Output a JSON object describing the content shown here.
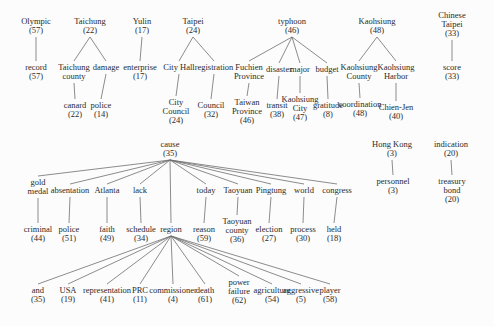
{
  "diagram": {
    "type": "tree",
    "colors": {
      "background": "#fcfcfc",
      "text": "#2b2b2b",
      "line": "#6e6e6e"
    },
    "nodes": [
      {
        "id": "olympic",
        "lines": [
          "Olympic",
          "(57)"
        ],
        "x": 36,
        "y": 17
      },
      {
        "id": "taichung",
        "lines": [
          "Taichung",
          "(22)"
        ],
        "x": 90,
        "y": 17
      },
      {
        "id": "yulin",
        "lines": [
          "Yulin",
          "(17)"
        ],
        "x": 142,
        "y": 17
      },
      {
        "id": "taipei",
        "lines": [
          "Taipei",
          "(24)"
        ],
        "x": 193,
        "y": 17
      },
      {
        "id": "typhoon",
        "lines": [
          "typhoon",
          "(46)"
        ],
        "x": 292,
        "y": 17
      },
      {
        "id": "kaohsiung",
        "lines": [
          "Kaohsiung",
          "(48)"
        ],
        "x": 377,
        "y": 17
      },
      {
        "id": "chinese-taipei",
        "lines": [
          "Chinese",
          "Taipei",
          "(33)"
        ],
        "x": 452,
        "y": 11
      },
      {
        "id": "record",
        "lines": [
          "record",
          "(57)"
        ],
        "x": 36,
        "y": 63
      },
      {
        "id": "taichung-county",
        "lines": [
          "Taichung",
          "county"
        ],
        "x": 74,
        "y": 63
      },
      {
        "id": "damage",
        "lines": [
          "damage"
        ],
        "x": 106,
        "y": 63
      },
      {
        "id": "enterprise",
        "lines": [
          "enterprise",
          "(17)"
        ],
        "x": 140,
        "y": 63
      },
      {
        "id": "city-hall",
        "lines": [
          "City Hall"
        ],
        "x": 179,
        "y": 63
      },
      {
        "id": "registration",
        "lines": [
          "registration"
        ],
        "x": 214,
        "y": 63
      },
      {
        "id": "fuchien-province",
        "lines": [
          "Fuchien",
          "Province"
        ],
        "x": 249,
        "y": 63
      },
      {
        "id": "disaster",
        "lines": [
          "disaster"
        ],
        "x": 279,
        "y": 65
      },
      {
        "id": "major",
        "lines": [
          "major"
        ],
        "x": 300,
        "y": 65
      },
      {
        "id": "budget",
        "lines": [
          "budget"
        ],
        "x": 327,
        "y": 65
      },
      {
        "id": "kaohsiung-county",
        "lines": [
          "Kaohsiung",
          "County"
        ],
        "x": 359,
        "y": 63
      },
      {
        "id": "kaohsiung-harbor",
        "lines": [
          "Kaohsiung",
          "Harbor"
        ],
        "x": 396,
        "y": 63
      },
      {
        "id": "score",
        "lines": [
          "score",
          "(33)"
        ],
        "x": 452,
        "y": 63
      },
      {
        "id": "canard",
        "lines": [
          "canard",
          "(22)"
        ],
        "x": 75,
        "y": 101
      },
      {
        "id": "police-14",
        "lines": [
          "police",
          "(14)"
        ],
        "x": 101,
        "y": 101
      },
      {
        "id": "city-council",
        "lines": [
          "City",
          "Council",
          "(24)"
        ],
        "x": 176,
        "y": 98
      },
      {
        "id": "council",
        "lines": [
          "Council",
          "(32)"
        ],
        "x": 211,
        "y": 101
      },
      {
        "id": "taiwan-province",
        "lines": [
          "Taiwan",
          "Province",
          "(46)"
        ],
        "x": 247,
        "y": 98
      },
      {
        "id": "transit",
        "lines": [
          "transit",
          "(38)"
        ],
        "x": 277,
        "y": 101
      },
      {
        "id": "kaohsiung-city",
        "lines": [
          "Kaohsiung",
          "City",
          "(47)"
        ],
        "x": 300,
        "y": 95
      },
      {
        "id": "gratitude",
        "lines": [
          "gratitude",
          "(8)"
        ],
        "x": 328,
        "y": 101
      },
      {
        "id": "coordination",
        "lines": [
          "coordination",
          "(48)"
        ],
        "x": 360,
        "y": 100
      },
      {
        "id": "chien-jen",
        "lines": [
          "Chien-Jen",
          "(40)"
        ],
        "x": 396,
        "y": 103
      },
      {
        "id": "cause",
        "lines": [
          "cause",
          "(35)"
        ],
        "x": 170,
        "y": 140
      },
      {
        "id": "hong-kong",
        "lines": [
          "Hong Kong",
          "(3)"
        ],
        "x": 392,
        "y": 140
      },
      {
        "id": "indication",
        "lines": [
          "indication",
          "(20)"
        ],
        "x": 451,
        "y": 140
      },
      {
        "id": "gold-medal",
        "lines": [
          "gold",
          "medal"
        ],
        "x": 38,
        "y": 178
      },
      {
        "id": "absentation",
        "lines": [
          "absentation"
        ],
        "x": 70,
        "y": 186
      },
      {
        "id": "atlanta",
        "lines": [
          "Atlanta"
        ],
        "x": 107,
        "y": 186
      },
      {
        "id": "lack",
        "lines": [
          "lack"
        ],
        "x": 140,
        "y": 186
      },
      {
        "id": "today",
        "lines": [
          "today"
        ],
        "x": 206,
        "y": 186
      },
      {
        "id": "taoyuan",
        "lines": [
          "Taoyuan"
        ],
        "x": 238,
        "y": 186
      },
      {
        "id": "pingtung",
        "lines": [
          "Pingtung"
        ],
        "x": 271,
        "y": 186
      },
      {
        "id": "world",
        "lines": [
          "world"
        ],
        "x": 304,
        "y": 186
      },
      {
        "id": "congress",
        "lines": [
          "congress"
        ],
        "x": 337,
        "y": 186
      },
      {
        "id": "personnel",
        "lines": [
          "personnel",
          "(3)"
        ],
        "x": 393,
        "y": 177
      },
      {
        "id": "treasury-bond",
        "lines": [
          "treasury",
          "bond",
          "(20)"
        ],
        "x": 452,
        "y": 177
      },
      {
        "id": "criminal",
        "lines": [
          "criminal",
          "(44)"
        ],
        "x": 38,
        "y": 225
      },
      {
        "id": "police-51",
        "lines": [
          "police",
          "(51)"
        ],
        "x": 69,
        "y": 225
      },
      {
        "id": "faith",
        "lines": [
          "faith",
          "(49)"
        ],
        "x": 107,
        "y": 225
      },
      {
        "id": "schedule",
        "lines": [
          "schedule",
          "(34)"
        ],
        "x": 141,
        "y": 225
      },
      {
        "id": "region",
        "lines": [
          "region"
        ],
        "x": 171,
        "y": 225
      },
      {
        "id": "reason",
        "lines": [
          "reason",
          "(59)"
        ],
        "x": 204,
        "y": 225
      },
      {
        "id": "taoyuan-county",
        "lines": [
          "Taoyuan",
          "county",
          "(36)"
        ],
        "x": 237,
        "y": 217
      },
      {
        "id": "election",
        "lines": [
          "election",
          "(27)"
        ],
        "x": 269,
        "y": 225
      },
      {
        "id": "process",
        "lines": [
          "process",
          "(30)"
        ],
        "x": 303,
        "y": 225
      },
      {
        "id": "held",
        "lines": [
          "held",
          "(18)"
        ],
        "x": 334,
        "y": 225
      },
      {
        "id": "and",
        "lines": [
          "and",
          "(35)"
        ],
        "x": 38,
        "y": 286
      },
      {
        "id": "usa",
        "lines": [
          "USA",
          "(19)"
        ],
        "x": 68,
        "y": 286
      },
      {
        "id": "representation",
        "lines": [
          "representation",
          "(41)"
        ],
        "x": 107,
        "y": 286
      },
      {
        "id": "prc",
        "lines": [
          "PRC",
          "(11)"
        ],
        "x": 140,
        "y": 286
      },
      {
        "id": "commissioner",
        "lines": [
          "commissioner",
          "(4)"
        ],
        "x": 173,
        "y": 286
      },
      {
        "id": "death",
        "lines": [
          "death",
          "(61)"
        ],
        "x": 205,
        "y": 286
      },
      {
        "id": "power-failure",
        "lines": [
          "power",
          "failure",
          "(62)"
        ],
        "x": 239,
        "y": 278
      },
      {
        "id": "agriculture",
        "lines": [
          "agriculture",
          "(54)"
        ],
        "x": 272,
        "y": 286
      },
      {
        "id": "aggressive",
        "lines": [
          "aggressive",
          "(5)"
        ],
        "x": 301,
        "y": 286
      },
      {
        "id": "player",
        "lines": [
          "player",
          "(58)"
        ],
        "x": 330,
        "y": 286
      }
    ],
    "edges": [
      [
        "olympic",
        "record"
      ],
      [
        "taichung",
        "taichung-county"
      ],
      [
        "taichung",
        "damage"
      ],
      [
        "taichung-county",
        "canard"
      ],
      [
        "damage",
        "police-14"
      ],
      [
        "yulin",
        "enterprise"
      ],
      [
        "taipei",
        "city-hall"
      ],
      [
        "taipei",
        "registration"
      ],
      [
        "city-hall",
        "city-council"
      ],
      [
        "registration",
        "council"
      ],
      [
        "typhoon",
        "fuchien-province"
      ],
      [
        "typhoon",
        "disaster"
      ],
      [
        "typhoon",
        "major"
      ],
      [
        "typhoon",
        "budget"
      ],
      [
        "fuchien-province",
        "taiwan-province"
      ],
      [
        "disaster",
        "transit"
      ],
      [
        "major",
        "kaohsiung-city"
      ],
      [
        "budget",
        "gratitude"
      ],
      [
        "kaohsiung",
        "kaohsiung-county"
      ],
      [
        "kaohsiung",
        "kaohsiung-harbor"
      ],
      [
        "kaohsiung-county",
        "coordination"
      ],
      [
        "kaohsiung-harbor",
        "chien-jen"
      ],
      [
        "chinese-taipei",
        "score"
      ],
      [
        "cause",
        "gold-medal"
      ],
      [
        "cause",
        "absentation"
      ],
      [
        "cause",
        "atlanta"
      ],
      [
        "cause",
        "lack"
      ],
      [
        "cause",
        "region"
      ],
      [
        "cause",
        "today"
      ],
      [
        "cause",
        "taoyuan"
      ],
      [
        "cause",
        "pingtung"
      ],
      [
        "cause",
        "world"
      ],
      [
        "cause",
        "congress"
      ],
      [
        "gold-medal",
        "criminal"
      ],
      [
        "absentation",
        "police-51"
      ],
      [
        "atlanta",
        "faith"
      ],
      [
        "lack",
        "schedule"
      ],
      [
        "today",
        "reason"
      ],
      [
        "taoyuan",
        "taoyuan-county"
      ],
      [
        "pingtung",
        "election"
      ],
      [
        "world",
        "process"
      ],
      [
        "congress",
        "held"
      ],
      [
        "region",
        "and"
      ],
      [
        "region",
        "usa"
      ],
      [
        "region",
        "representation"
      ],
      [
        "region",
        "prc"
      ],
      [
        "region",
        "commissioner"
      ],
      [
        "region",
        "death"
      ],
      [
        "region",
        "power-failure"
      ],
      [
        "region",
        "agriculture"
      ],
      [
        "region",
        "aggressive"
      ],
      [
        "region",
        "player"
      ],
      [
        "hong-kong",
        "personnel"
      ],
      [
        "indication",
        "treasury-bond"
      ]
    ]
  }
}
